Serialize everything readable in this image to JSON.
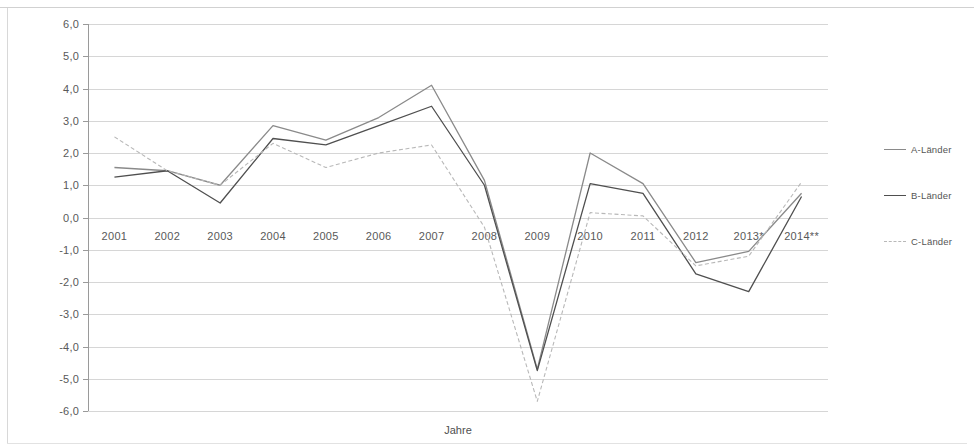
{
  "chart_data": {
    "type": "line",
    "title": "",
    "xlabel": "Jahre",
    "ylabel": "",
    "categories": [
      "2001",
      "2002",
      "2003",
      "2004",
      "2005",
      "2006",
      "2007",
      "2008",
      "2009",
      "2010",
      "2011",
      "2012",
      "2013*",
      "2014**"
    ],
    "ylim": [
      -6.0,
      6.0
    ],
    "ytick_labels": [
      "6,0",
      "5,0",
      "4,0",
      "3,0",
      "2,0",
      "1,0",
      "0,0",
      "-1,0",
      "-2,0",
      "-3,0",
      "-4,0",
      "-5,0",
      "-6,0"
    ],
    "ytick_values": [
      6,
      5,
      4,
      3,
      2,
      1,
      0,
      -1,
      -2,
      -3,
      -4,
      -5,
      -6
    ],
    "grid": true,
    "legend_position": "right",
    "series": [
      {
        "name": "A-Länder",
        "color": "#8a8a8a",
        "style": "solid",
        "values": [
          1.55,
          1.45,
          1.0,
          2.85,
          2.4,
          3.1,
          4.1,
          1.15,
          -4.7,
          2.0,
          1.05,
          -1.4,
          -1.05,
          0.75
        ]
      },
      {
        "name": "B-Länder",
        "color": "#4f4f4f",
        "style": "solid",
        "values": [
          1.25,
          1.45,
          0.45,
          2.45,
          2.25,
          2.85,
          3.45,
          1.0,
          -4.75,
          1.05,
          0.75,
          -1.75,
          -2.3,
          0.65
        ]
      },
      {
        "name": "C-Länder",
        "color": "#b8b8b8",
        "style": "dashed",
        "values": [
          2.5,
          1.45,
          1.0,
          2.3,
          1.55,
          2.0,
          2.25,
          -0.3,
          -5.7,
          0.15,
          0.05,
          -1.5,
          -1.2,
          1.1
        ]
      }
    ]
  },
  "legend": {
    "items": [
      {
        "label": "A-Länder"
      },
      {
        "label": "B-Länder"
      },
      {
        "label": "C-Länder"
      }
    ]
  },
  "axis": {
    "x_title": "Jahre"
  }
}
